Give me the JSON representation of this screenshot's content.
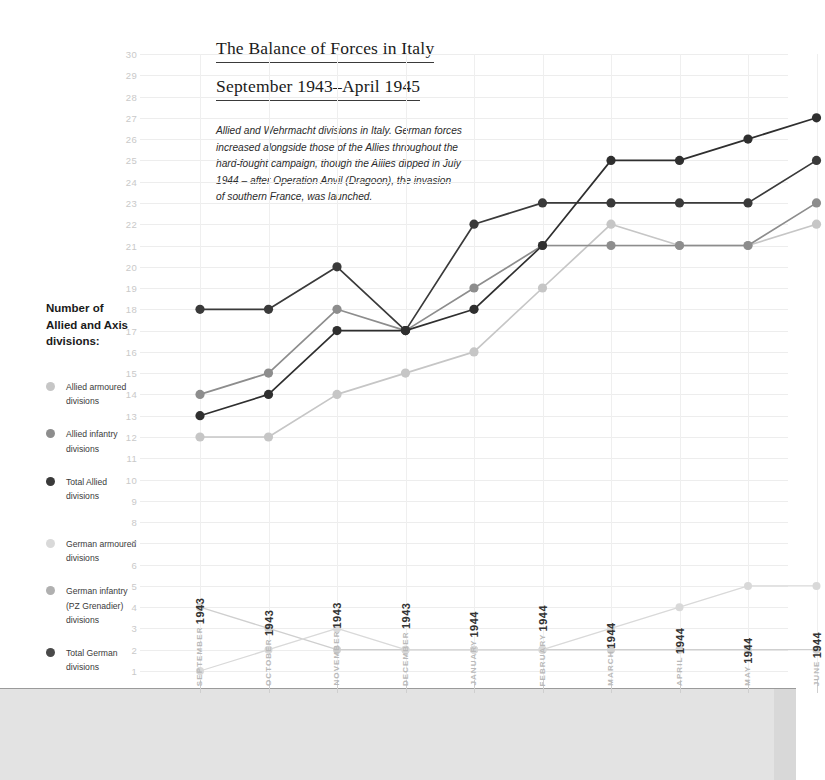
{
  "title": {
    "line1": "The Balance of Forces in Italy",
    "line2": "September 1943–April 1945"
  },
  "description": "Allied and Wehrmacht divisions in Italy. German forces increased alongside those of the Allies throughout the hard-fought campaign, though the Allies dipped in July 1944 – after Operation Anvil (Dragoon), the invasion of southern France, was launched.",
  "legend": {
    "title": "Number of Allied and Axis divisions:",
    "title_lines": [
      "Number of",
      "Allied and Axis",
      "divisions:"
    ],
    "items": [
      {
        "label": "Allied armoured divisions",
        "line1": "Allied armoured",
        "line2": "divisions",
        "color": "#c6c6c6"
      },
      {
        "label": "Allied infantry divisions",
        "line1": "Allied infantry",
        "line2": "divisions",
        "color": "#8d8d8d"
      },
      {
        "label": "Total Allied divisions",
        "line1": "Total Allied",
        "line2": "divisions",
        "color": "#3a3a3a"
      },
      {
        "label": "German armoured divisions",
        "line1": "German armoured",
        "line2": "divisions",
        "color": "#d9d9d9"
      },
      {
        "label": "German infantry (PZ Grenadier) divisions",
        "line1": "German infantry",
        "line2": "(PZ Grenadier) divisions",
        "color": "#b0b0b0"
      },
      {
        "label": "Total German divisions",
        "line1": "Total German",
        "line2": "divisions",
        "color": "#4a4a4a"
      }
    ]
  },
  "axis": {
    "y_ticks": [
      30,
      29,
      28,
      27,
      26,
      25,
      24,
      23,
      22,
      21,
      20,
      19,
      18,
      17,
      16,
      15,
      14,
      13,
      12,
      11,
      10,
      9,
      8,
      7,
      6,
      5,
      4,
      3,
      2,
      1
    ],
    "x_labels": [
      {
        "month": "SEPTEMBER",
        "year": "1943"
      },
      {
        "month": "OCTOBER",
        "year": "1943"
      },
      {
        "month": "NOVEMBER",
        "year": "1943"
      },
      {
        "month": "DECEMBER",
        "year": "1943"
      },
      {
        "month": "JANUARY",
        "year": "1944"
      },
      {
        "month": "FEBRUARY",
        "year": "1944"
      },
      {
        "month": "MARCH",
        "year": "1944"
      },
      {
        "month": "APRIL",
        "year": "1944"
      },
      {
        "month": "MAY",
        "year": "1944"
      },
      {
        "month": "JUNE",
        "year": "1944"
      }
    ]
  },
  "chart_data": {
    "type": "line",
    "title": "The Balance of Forces in Italy September 1943–April 1945",
    "xlabel": "",
    "ylabel": "Number of Allied and Axis divisions",
    "ylim": [
      1,
      30
    ],
    "grid": true,
    "legend_position": "left",
    "categories": [
      "SEPTEMBER 1943",
      "OCTOBER 1943",
      "NOVEMBER 1943",
      "DECEMBER 1943",
      "JANUARY 1944",
      "FEBRUARY 1944",
      "MARCH 1944",
      "APRIL 1944",
      "MAY 1944",
      "JUNE 1944"
    ],
    "series": [
      {
        "name": "Allied armoured divisions",
        "color": "#c6c6c6",
        "values": [
          12,
          12,
          14,
          15,
          16,
          19,
          22,
          21,
          21,
          22
        ]
      },
      {
        "name": "Allied infantry divisions",
        "color": "#8d8d8d",
        "values": [
          14,
          15,
          18,
          17,
          19,
          21,
          21,
          21,
          21,
          23
        ]
      },
      {
        "name": "Total Allied divisions",
        "color": "#3a3a3a",
        "values": [
          18,
          18,
          20,
          17,
          22,
          23,
          23,
          23,
          23,
          25
        ]
      },
      {
        "name": "Total Allied (upper)",
        "color": "#2f2f2f",
        "values": [
          13,
          14,
          17,
          17,
          18,
          21,
          25,
          25,
          26,
          27
        ]
      },
      {
        "name": "German armoured divisions",
        "color": "#d9d9d9",
        "values": [
          1,
          2,
          3,
          2,
          2,
          2,
          3,
          4,
          5,
          5
        ]
      },
      {
        "name": "German infantry (PZ Grenadier) divisions",
        "color": "#cfcfcf",
        "values": [
          4,
          3,
          2,
          2,
          2,
          2,
          2,
          2,
          2,
          2
        ]
      }
    ]
  }
}
